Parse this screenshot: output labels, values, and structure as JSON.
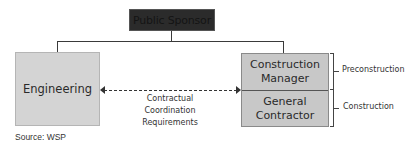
{
  "diagram": {
    "title_box": "Public Sponsor",
    "left_box": "Engineering",
    "right_box": {
      "top": "Construction Manager",
      "top_line1": "Construction",
      "top_line2": "Manager",
      "bottom": "General Contractor",
      "bottom_line1": "General",
      "bottom_line2": "Contractor"
    },
    "relationship_label": {
      "line1": "Contractual",
      "line2": "Coordination",
      "line3": "Requirements"
    },
    "phases": {
      "top": "Preconstruction",
      "bottom": "Construction"
    },
    "source": "Source: WSP",
    "colors": {
      "sponsor_fill": "#2b2b2b",
      "box_fill": "#d4d4d4",
      "cmgc_fill": "#c8c8c8",
      "line": "#3a3a3a"
    }
  }
}
